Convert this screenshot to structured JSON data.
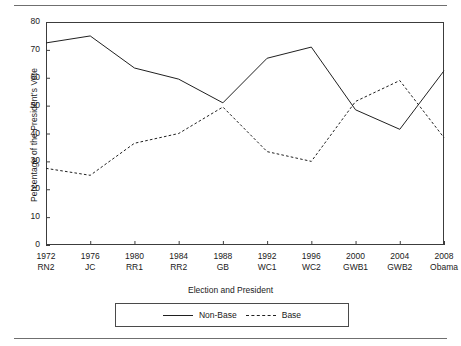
{
  "figure": {
    "ylabel": "Percentage of the President's Vote",
    "xlabel": "Election and President"
  },
  "legend": {
    "items": [
      {
        "label": "Non-Base",
        "style": "solid"
      },
      {
        "label": "Base",
        "style": "dashed"
      }
    ]
  },
  "axis": {
    "yticks": [
      "0",
      "10",
      "20",
      "30",
      "40",
      "50",
      "60",
      "70",
      "80"
    ],
    "xticks": [
      {
        "year": "1972",
        "president": "RN2"
      },
      {
        "year": "1976",
        "president": "JC"
      },
      {
        "year": "1980",
        "president": "RR1"
      },
      {
        "year": "1984",
        "president": "RR2"
      },
      {
        "year": "1988",
        "president": "GB"
      },
      {
        "year": "1992",
        "president": "WC1"
      },
      {
        "year": "1996",
        "president": "WC2"
      },
      {
        "year": "2000",
        "president": "GWB1"
      },
      {
        "year": "2004",
        "president": "GWB2"
      },
      {
        "year": "2008",
        "president": "Obama"
      }
    ]
  },
  "chart_data": {
    "type": "line",
    "title": "",
    "xlabel": "Election and President",
    "ylabel": "Percentage of the President's Vote",
    "categories": [
      "1972 RN2",
      "1976 JC",
      "1980 RR1",
      "1984 RR2",
      "1988 GB",
      "1992 WC1",
      "1996 WC2",
      "2000 GWB1",
      "2004 GWB2",
      "2008 Obama"
    ],
    "ylim": [
      0,
      80
    ],
    "ytick_step": 10,
    "grid": false,
    "legend_position": "bottom-center",
    "series": [
      {
        "name": "Non-Base",
        "style": "solid",
        "color": "#202020",
        "values": [
          72.5,
          75.0,
          63.5,
          59.5,
          51.0,
          67.0,
          71.0,
          48.5,
          41.5,
          62.5
        ]
      },
      {
        "name": "Base",
        "style": "dashed",
        "color": "#202020",
        "values": [
          27.5,
          25.0,
          36.5,
          40.0,
          49.5,
          33.5,
          30.0,
          51.5,
          59.0,
          38.5
        ]
      }
    ]
  }
}
